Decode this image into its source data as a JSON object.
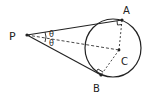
{
  "diagram": {
    "type": "tangent-lines-to-circle",
    "points": {
      "P": {
        "label": "P"
      },
      "A": {
        "label": "A"
      },
      "B": {
        "label": "B"
      },
      "C": {
        "label": "C"
      }
    },
    "angles": {
      "upper": "θ",
      "lower": "θ"
    },
    "colors": {
      "ink": "#222222",
      "background": "#ffffff"
    }
  }
}
